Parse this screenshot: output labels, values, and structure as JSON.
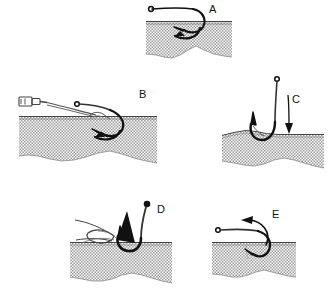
{
  "figure": {
    "background_color": "#ffffff",
    "ink_color": "#111111",
    "tissue_fill_color": "#c8c8c8",
    "tissue_outline_color": "#555555",
    "panel_count": 5
  },
  "panels": [
    {
      "id": "A",
      "label": "A",
      "caption": "Hook embedded in skin, barb below surface",
      "label_x": 209,
      "label_y": 4
    },
    {
      "id": "B",
      "label": "B",
      "caption": "Clamp or hemostat grasping hook shank at entry point",
      "label_x": 139,
      "label_y": 89
    },
    {
      "id": "C",
      "label": "C",
      "caption": "Downward pressure applied to hook shank to disengage barb",
      "label_x": 292,
      "label_y": 94
    },
    {
      "id": "D",
      "label": "D",
      "caption": "Needle or instrument advanced along hook to cover barb",
      "label_x": 157,
      "label_y": 204
    },
    {
      "id": "E",
      "label": "E",
      "caption": "Hook backed out along its entry path",
      "label_x": 272,
      "label_y": 209
    }
  ],
  "annotations": {
    "arrow_a": "curved-arrow-under-skin-leftward",
    "arrow_b": "curved-arrow-under-skin-leftward",
    "arrow_c": "straight-arrow-downward",
    "arrow_d": "solid-arrow-upward",
    "arrow_e": "curved-arrow-leftward-outward"
  },
  "objects": {
    "hook": "fishhook",
    "clamp": "hemostat-clamp",
    "needle": "hypodermic-needle",
    "tissue": "skin-cross-section"
  }
}
